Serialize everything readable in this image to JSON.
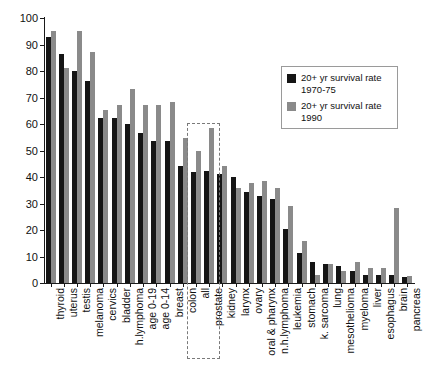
{
  "chart_data": {
    "type": "bar",
    "title": "",
    "xlabel": "",
    "ylabel": "",
    "ylim": [
      0,
      100
    ],
    "yticks": [
      0,
      10,
      20,
      30,
      40,
      50,
      60,
      70,
      80,
      90,
      100
    ],
    "grid": false,
    "legend_position": "top-right",
    "categories": [
      "thyroid",
      "uterus",
      "testis",
      "melanoma",
      "cervics",
      "bladder",
      "h.lymphoma",
      "age 0-19",
      "age 0-14",
      "breast",
      "colon",
      "all",
      "prostate",
      "kidney",
      "larynx",
      "ovary",
      "oral & pharynx",
      "n.h.lymphoma",
      "leukemia",
      "stomach",
      "k. sarcoma",
      "lung",
      "mesothelioma",
      "myeloma",
      "liver",
      "esophagus",
      "brain",
      "pancreas"
    ],
    "series": [
      {
        "name": "20+ yr survival rate 1970-75",
        "color": "#151515",
        "values": [
          93.0,
          86.4,
          80.0,
          76.1,
          62.2,
          62.2,
          59.9,
          56.5,
          53.5,
          53.5,
          44.2,
          42.0,
          42.1,
          41.2,
          39.9,
          34.2,
          32.7,
          31.8,
          20.4,
          11.4,
          7.9,
          7.2,
          6.3,
          4.5,
          3.1,
          3.0,
          2.9,
          2.2
        ]
      },
      {
        "name": "20+ yr survival rate 1990",
        "color": "#8a8a8a",
        "values": [
          95.2,
          81.1,
          95.2,
          87.1,
          65.3,
          67.2,
          73.1,
          67.2,
          67.2,
          68.3,
          54.8,
          49.7,
          58.4,
          44.1,
          35.9,
          37.8,
          38.5,
          35.8,
          29.2,
          15.9,
          2.9,
          7.2,
          4.4,
          8.0,
          5.5,
          5.8,
          28.4,
          2.7
        ]
      }
    ],
    "annotations": [
      {
        "type": "dashed-rectangle",
        "covers": [
          "all",
          "prostate"
        ],
        "color": "#7a7a7a"
      }
    ]
  },
  "legend": {
    "items": [
      {
        "label_line1": "20+ yr survival rate",
        "label_line2": "1970-75",
        "color": "#151515"
      },
      {
        "label_line1": "20+ yr survival rate",
        "label_line2": "1990",
        "color": "#8a8a8a"
      }
    ]
  }
}
